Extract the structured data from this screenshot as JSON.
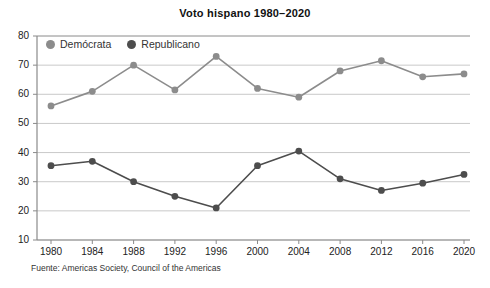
{
  "chart_data": {
    "type": "line",
    "title": "Voto hispano 1980–2020",
    "xlabel": "",
    "ylabel": "",
    "categories": [
      "1980",
      "1984",
      "1988",
      "1992",
      "1996",
      "2000",
      "2004",
      "2008",
      "2012",
      "2016",
      "2020"
    ],
    "series": [
      {
        "name": "Demócrata",
        "color": "#8c8c8c",
        "values": [
          56,
          61,
          70,
          61.5,
          73,
          62,
          59,
          68,
          71.5,
          66,
          67
        ]
      },
      {
        "name": "Republicano",
        "color": "#4d4d4d",
        "values": [
          35.5,
          37,
          30,
          25,
          21,
          35.5,
          40.5,
          31,
          27,
          29.5,
          32.5
        ]
      }
    ],
    "ylim": [
      10,
      80
    ],
    "yticks": [
      10,
      20,
      30,
      40,
      50,
      60,
      70,
      80
    ],
    "grid": true,
    "legend_position": "top-left",
    "source": "Fuente: Americas Society, Council of the Americas"
  },
  "legend": {
    "items": [
      {
        "label": "Demócrata"
      },
      {
        "label": "Republicano"
      }
    ]
  },
  "colors": {
    "democrat": "#8c8c8c",
    "republican": "#4d4d4d",
    "grid": "#c9c9c9",
    "axis": "#8a8a8a",
    "text": "#1a1a1a"
  }
}
